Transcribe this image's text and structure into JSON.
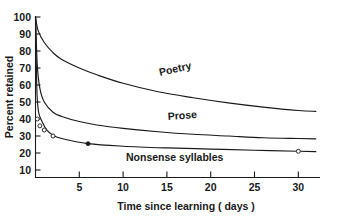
{
  "chart_data": {
    "type": "line",
    "title": "",
    "xlabel": "Time since learning ( days )",
    "ylabel": "Percent retained",
    "xlim": [
      0,
      32.5
    ],
    "ylim": [
      0,
      100
    ],
    "grid": false,
    "legend_position": "inline-curve-labels",
    "xticks": [
      5,
      10,
      15,
      20,
      25,
      30
    ],
    "xtick_labels": [
      "5",
      "10",
      "15",
      "20",
      "25",
      "30"
    ],
    "yticks": [
      10,
      20,
      30,
      40,
      50,
      60,
      70,
      80,
      90,
      100
    ],
    "ytick_labels": [
      "10",
      "20",
      "30",
      "40",
      "50",
      "60",
      "70",
      "80",
      "90",
      "100"
    ],
    "series": [
      {
        "name": "Poetry",
        "label": "Poetry",
        "x": [
          0,
          0.3,
          1,
          2,
          3,
          5,
          7,
          10,
          14,
          18,
          22,
          26,
          30,
          32
        ],
        "values": [
          100,
          92,
          85,
          79,
          75,
          70,
          66,
          61,
          56,
          52.5,
          49.5,
          47,
          45,
          44.5
        ]
      },
      {
        "name": "Prose",
        "label": "Prose",
        "x": [
          0,
          0.2,
          0.5,
          1,
          2,
          3,
          5,
          7,
          10,
          14,
          18,
          22,
          26,
          30,
          32
        ],
        "values": [
          100,
          72,
          58,
          50,
          44,
          41.5,
          38.5,
          36.5,
          34.5,
          32.5,
          31,
          30,
          29,
          28.5,
          28.3
        ]
      },
      {
        "name": "Nonsense syllables",
        "label": "Nonsense syllables",
        "x": [
          0,
          0.15,
          0.35,
          0.8,
          1.3,
          2,
          3,
          6,
          10,
          15,
          20,
          25,
          30,
          32
        ],
        "values": [
          100,
          58,
          44,
          38,
          33.5,
          30.5,
          28.5,
          25.5,
          24,
          23,
          22.3,
          21.6,
          21,
          20.8
        ],
        "markers": [
          {
            "x": 0.2,
            "y": 40,
            "filled": false
          },
          {
            "x": 0.5,
            "y": 36,
            "filled": false
          },
          {
            "x": 1.0,
            "y": 33.5,
            "filled": false
          },
          {
            "x": 2.0,
            "y": 30,
            "filled": false
          },
          {
            "x": 6.0,
            "y": 25.5,
            "filled": true
          },
          {
            "x": 30.0,
            "y": 21,
            "filled": false
          }
        ]
      }
    ]
  }
}
